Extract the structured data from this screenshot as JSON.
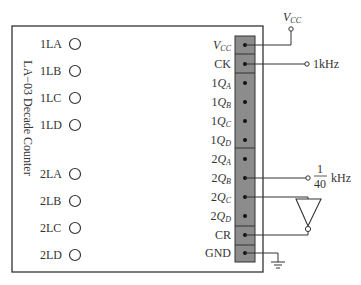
{
  "module": {
    "title": "LA−03 Decade Counter",
    "left_inputs": [
      {
        "label": "1LA"
      },
      {
        "label": "1LB"
      },
      {
        "label": "1LC"
      },
      {
        "label": "1LD"
      },
      {
        "label": "2LA"
      },
      {
        "label": "2LB"
      },
      {
        "label": "2LC"
      },
      {
        "label": "2LD"
      }
    ],
    "pins": [
      {
        "prefix": "",
        "main": "V",
        "sub": "CC"
      },
      {
        "prefix": "",
        "main": "CK",
        "sub": ""
      },
      {
        "prefix": "1",
        "main": "Q",
        "sub": "A"
      },
      {
        "prefix": "1",
        "main": "Q",
        "sub": "B"
      },
      {
        "prefix": "1",
        "main": "Q",
        "sub": "C"
      },
      {
        "prefix": "1",
        "main": "Q",
        "sub": "D"
      },
      {
        "prefix": "2",
        "main": "Q",
        "sub": "A"
      },
      {
        "prefix": "2",
        "main": "Q",
        "sub": "B"
      },
      {
        "prefix": "2",
        "main": "Q",
        "sub": "C"
      },
      {
        "prefix": "2",
        "main": "Q",
        "sub": "D"
      },
      {
        "prefix": "",
        "main": "CR",
        "sub": ""
      },
      {
        "prefix": "",
        "main": "GND",
        "sub": ""
      }
    ]
  },
  "external": {
    "vcc": {
      "main": "V",
      "sub": "CC"
    },
    "clock": "1kHz",
    "output_freq": {
      "num": "1",
      "den": "40",
      "unit": "kHz"
    }
  },
  "colors": {
    "strip": "#8c8c8c",
    "line": "#333333"
  }
}
